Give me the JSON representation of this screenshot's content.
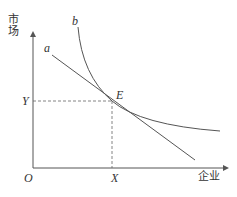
{
  "diagram": {
    "y_axis_label": "市场",
    "x_axis_label": "企业",
    "origin_label": "O",
    "curve_a_label": "a",
    "curve_b_label": "b",
    "point_label": "E",
    "x_tick_label": "X",
    "y_tick_label": "Y",
    "colors": {
      "lines": "#555555",
      "text": "#333333"
    }
  }
}
